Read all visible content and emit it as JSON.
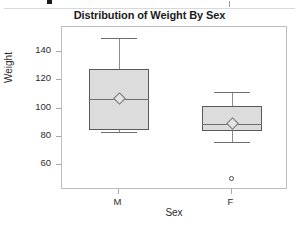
{
  "top_strip": {
    "present": true,
    "tick_icon": "black-square-marker",
    "caret_icon": "thin-vertical-caret"
  },
  "chart_data": {
    "type": "box",
    "title": "Distribution of Weight By Sex",
    "xlabel": "Sex",
    "ylabel": "Weight",
    "categories": [
      "M",
      "F"
    ],
    "ytick_labels": [
      "140",
      "120",
      "100",
      "80",
      "60"
    ],
    "ytick_values": [
      140,
      120,
      100,
      80,
      60
    ],
    "ylim": [
      42,
      158
    ],
    "grid": false,
    "legend": false,
    "boxes": [
      {
        "category": "M",
        "whisker_low": 83,
        "q1": 85,
        "median": 107,
        "mean": 108,
        "q3": 128,
        "whisker_high": 150,
        "outliers": []
      },
      {
        "category": "F",
        "whisker_low": 76,
        "q1": 84,
        "median": 89,
        "mean": 90,
        "q3": 102,
        "whisker_high": 112,
        "outliers": [
          50
        ]
      }
    ],
    "colors": {
      "box_fill": "#dcdcdc",
      "box_edge": "#5a5a5a",
      "whisker": "#8c8c8c",
      "median": "#6e6e6e",
      "mean_marker": "#e4e4e4",
      "outlier_edge": "#4a4a4a",
      "frame": "#bdbdbd",
      "text": "#2b2b2b",
      "title": "#1b1b1b",
      "background": "#ffffff"
    }
  }
}
